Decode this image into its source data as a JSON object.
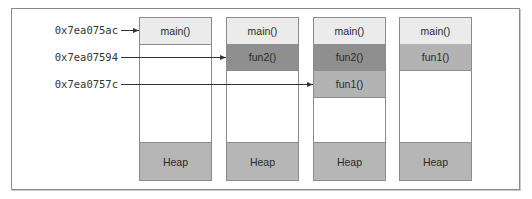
{
  "diagram": {
    "colors": {
      "frame_border": "#8a8a8a",
      "cell_border": "#8c8c8c",
      "main": "#ebebeb",
      "fun2": "#8f8f8f",
      "fun1": "#b3b3b3",
      "heap": "#b6b6b6",
      "empty": "#ffffff",
      "arrow": "#333333"
    },
    "addresses": [
      {
        "label": "0x7ea075ac",
        "y": 30,
        "target_stack": 0
      },
      {
        "label": "0x7ea07594",
        "y": 57,
        "target_stack": 1
      },
      {
        "label": "0x7ea0757c",
        "y": 84,
        "target_stack": 2
      }
    ],
    "stacks": [
      {
        "name": "stack-1",
        "frames": [
          {
            "label": "main()",
            "kind": "main"
          }
        ],
        "heap_label": "Heap"
      },
      {
        "name": "stack-2",
        "frames": [
          {
            "label": "main()",
            "kind": "main"
          },
          {
            "label": "fun2()",
            "kind": "fun2"
          }
        ],
        "heap_label": "Heap"
      },
      {
        "name": "stack-3",
        "frames": [
          {
            "label": "main()",
            "kind": "main"
          },
          {
            "label": "fun2()",
            "kind": "fun2"
          },
          {
            "label": "fun1()",
            "kind": "fun1"
          }
        ],
        "heap_label": "Heap"
      },
      {
        "name": "stack-4",
        "frames": [
          {
            "label": "main()",
            "kind": "main"
          },
          {
            "label": "fun1()",
            "kind": "fun1"
          }
        ],
        "heap_label": "Heap"
      }
    ]
  }
}
